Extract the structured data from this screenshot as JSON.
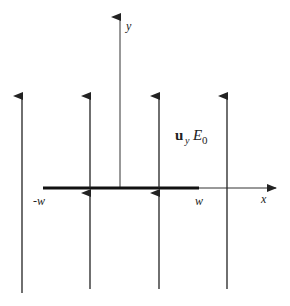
{
  "figure": {
    "type": "field-diagram",
    "axes": {
      "x_label": "x",
      "y_label": "y"
    },
    "strip": {
      "left_label": "-w",
      "right_label": "w"
    },
    "field_label": {
      "vector": "u",
      "subscript": "y",
      "magnitude": "E",
      "magnitude_subscript": "0"
    },
    "field_lines_count": 4,
    "colors": {
      "line": "#222222",
      "background": "#ffffff"
    }
  }
}
